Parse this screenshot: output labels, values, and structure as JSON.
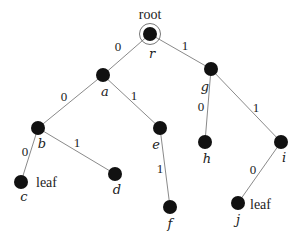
{
  "diagram": {
    "title": "",
    "type": "binary-trie",
    "colors": {
      "node": "#111111",
      "edge": "#8a8a8a",
      "text": "#222222",
      "background": "#ffffff"
    },
    "root_annotation": {
      "text": "root",
      "x": 150,
      "y": 19
    },
    "nodes": [
      {
        "id": "r",
        "label": "r",
        "x": 150,
        "y": 34,
        "label_x": 152,
        "label_y": 58,
        "is_root": true
      },
      {
        "id": "a",
        "label": "a",
        "x": 103,
        "y": 75,
        "label_x": 105,
        "label_y": 96
      },
      {
        "id": "g",
        "label": "g",
        "x": 211,
        "y": 69,
        "label_x": 205,
        "label_y": 91
      },
      {
        "id": "b",
        "label": "b",
        "x": 38,
        "y": 128,
        "label_x": 42,
        "label_y": 148
      },
      {
        "id": "e",
        "label": "e",
        "x": 160,
        "y": 128,
        "label_x": 156,
        "label_y": 149
      },
      {
        "id": "h",
        "label": "h",
        "x": 205,
        "y": 142,
        "label_x": 207,
        "label_y": 163
      },
      {
        "id": "i",
        "label": "i",
        "x": 281,
        "y": 142,
        "label_x": 284,
        "label_y": 162
      },
      {
        "id": "c",
        "label": "c",
        "x": 21,
        "y": 182,
        "label_x": 24,
        "label_y": 201
      },
      {
        "id": "d",
        "label": "d",
        "x": 115,
        "y": 174,
        "label_x": 117,
        "label_y": 194
      },
      {
        "id": "f",
        "label": "f",
        "x": 170,
        "y": 207,
        "label_x": 170,
        "label_y": 228
      },
      {
        "id": "j",
        "label": "j",
        "x": 238,
        "y": 203,
        "label_x": 238,
        "label_y": 224
      }
    ],
    "edges": [
      {
        "from": "r",
        "to": "a",
        "label": "0",
        "x1": 150,
        "y1": 34,
        "x2": 103,
        "y2": 75,
        "label_x": 118,
        "label_y": 51
      },
      {
        "from": "r",
        "to": "g",
        "label": "1",
        "x1": 150,
        "y1": 34,
        "x2": 211,
        "y2": 69,
        "label_x": 185,
        "label_y": 50
      },
      {
        "from": "a",
        "to": "b",
        "label": "0",
        "x1": 103,
        "y1": 75,
        "x2": 38,
        "y2": 128,
        "label_x": 64,
        "label_y": 101
      },
      {
        "from": "a",
        "to": "e",
        "label": "1",
        "x1": 103,
        "y1": 75,
        "x2": 160,
        "y2": 128,
        "label_x": 134,
        "label_y": 100
      },
      {
        "from": "g",
        "to": "h",
        "label": "0",
        "x1": 211,
        "y1": 69,
        "x2": 205,
        "y2": 142,
        "label_x": 201,
        "label_y": 111
      },
      {
        "from": "g",
        "to": "i",
        "label": "1",
        "x1": 211,
        "y1": 69,
        "x2": 281,
        "y2": 142,
        "label_x": 256,
        "label_y": 112
      },
      {
        "from": "b",
        "to": "c",
        "label": "0",
        "x1": 38,
        "y1": 128,
        "x2": 21,
        "y2": 182,
        "label_x": 25,
        "label_y": 156
      },
      {
        "from": "b",
        "to": "d",
        "label": "1",
        "x1": 38,
        "y1": 128,
        "x2": 115,
        "y2": 174,
        "label_x": 77,
        "label_y": 147
      },
      {
        "from": "e",
        "to": "f",
        "label": "1",
        "x1": 160,
        "y1": 128,
        "x2": 170,
        "y2": 207,
        "label_x": 160,
        "label_y": 173
      },
      {
        "from": "i",
        "to": "j",
        "label": "0",
        "x1": 281,
        "y1": 142,
        "x2": 238,
        "y2": 203,
        "label_x": 253,
        "label_y": 174
      }
    ],
    "annotations": [
      {
        "text": "leaf",
        "target": "c",
        "x": 36,
        "y": 187
      },
      {
        "text": "leaf",
        "target": "j",
        "x": 250,
        "y": 209
      }
    ]
  }
}
